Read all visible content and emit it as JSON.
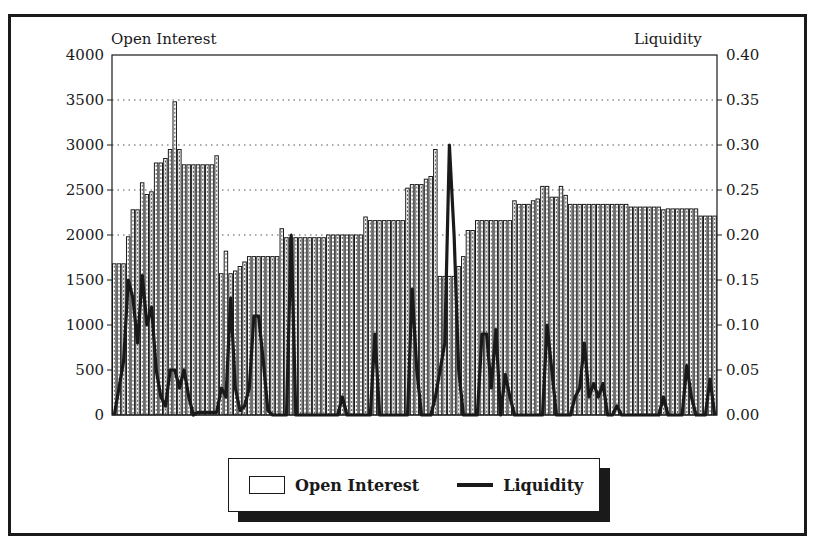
{
  "chart_data": {
    "type": "bar",
    "title": "",
    "left_axis_title": "Open Interest",
    "right_axis_title": "Liquidity",
    "xlabel": "",
    "ylabel": "Open Interest",
    "ylabel_right": "Liquidity",
    "ylim": [
      0,
      4000
    ],
    "ylim_right": [
      0,
      0.4
    ],
    "left_ticks": [
      "4000",
      "3500",
      "3000",
      "2500",
      "2000",
      "1500",
      "1000",
      "500",
      "0"
    ],
    "right_ticks": [
      "0.40",
      "0.35",
      "0.30",
      "0.25",
      "0.20",
      "0.15",
      "0.10",
      "0.05",
      "0.00"
    ],
    "grid": "horizontal dotted",
    "legend_position": "bottom",
    "series": [
      {
        "name": "Open Interest",
        "type": "bar",
        "values": [
          1680,
          1680,
          1680,
          1980,
          2280,
          2280,
          2580,
          2450,
          2480,
          2800,
          2800,
          2850,
          2950,
          3480,
          2950,
          2780,
          2780,
          2780,
          2780,
          2780,
          2780,
          2780,
          2880,
          1570,
          1820,
          1570,
          1600,
          1650,
          1700,
          1760,
          1760,
          1760,
          1760,
          1760,
          1760,
          1760,
          2070,
          1970,
          1970,
          1970,
          1970,
          1970,
          1970,
          1970,
          1970,
          1970,
          2000,
          2000,
          2000,
          2000,
          2000,
          2000,
          2000,
          2000,
          2200,
          2160,
          2160,
          2160,
          2160,
          2160,
          2160,
          2160,
          2160,
          2520,
          2560,
          2560,
          2560,
          2620,
          2650,
          2950,
          1540,
          1540,
          1540,
          1540,
          1650,
          1760,
          2050,
          2050,
          2160,
          2160,
          2160,
          2160,
          2160,
          2160,
          2160,
          2160,
          2380,
          2340,
          2340,
          2340,
          2380,
          2400,
          2540,
          2540,
          2420,
          2420,
          2540,
          2440,
          2340,
          2340,
          2340,
          2340,
          2340,
          2340,
          2340,
          2340,
          2340,
          2340,
          2340,
          2340,
          2340,
          2310,
          2310,
          2310,
          2310,
          2310,
          2310,
          2310,
          2280,
          2290,
          2290,
          2290,
          2290,
          2290,
          2290,
          2290,
          2210,
          2210,
          2210,
          2210
        ]
      },
      {
        "name": "Liquidity",
        "type": "line",
        "values": [
          0.0,
          0.03,
          0.06,
          0.15,
          0.13,
          0.08,
          0.155,
          0.1,
          0.12,
          0.05,
          0.02,
          0.01,
          0.05,
          0.05,
          0.03,
          0.05,
          0.02,
          0.0,
          0.003,
          0.003,
          0.003,
          0.003,
          0.003,
          0.03,
          0.02,
          0.13,
          0.03,
          0.005,
          0.01,
          0.03,
          0.11,
          0.11,
          0.06,
          0.005,
          0.0,
          0.0,
          0.0,
          0.0,
          0.2,
          0.0,
          0.0,
          0.0,
          0.0,
          0.0,
          0.0,
          0.0,
          0.0,
          0.0,
          0.0,
          0.02,
          0.0,
          0.0,
          0.0,
          0.0,
          0.0,
          0.0,
          0.09,
          0.0,
          0.0,
          0.0,
          0.0,
          0.0,
          0.0,
          0.0,
          0.14,
          0.05,
          0.0,
          0.0,
          0.0,
          0.02,
          0.05,
          0.08,
          0.3,
          0.2,
          0.05,
          0.0,
          0.0,
          0.0,
          0.0,
          0.09,
          0.09,
          0.03,
          0.095,
          0.0,
          0.045,
          0.02,
          0.0,
          0.0,
          0.0,
          0.0,
          0.0,
          0.0,
          0.0,
          0.1,
          0.05,
          0.0,
          0.0,
          0.0,
          0.0,
          0.02,
          0.03,
          0.08,
          0.02,
          0.035,
          0.02,
          0.035,
          0.0,
          0.0,
          0.01,
          0.0,
          0.0,
          0.0,
          0.0,
          0.0,
          0.0,
          0.0,
          0.0,
          0.0,
          0.02,
          0.0,
          0.0,
          0.0,
          0.0,
          0.055,
          0.02,
          0.0,
          0.0,
          0.0,
          0.04,
          0.0
        ]
      }
    ]
  },
  "legend": {
    "items": [
      {
        "label": "Open Interest",
        "symbol": "box"
      },
      {
        "label": "Liquidity",
        "symbol": "line"
      }
    ]
  },
  "colors": {
    "ink": "#1a1a1a",
    "bar_fill": "#ffffff",
    "bar_hatch": "#555555",
    "grid": "#555555"
  }
}
